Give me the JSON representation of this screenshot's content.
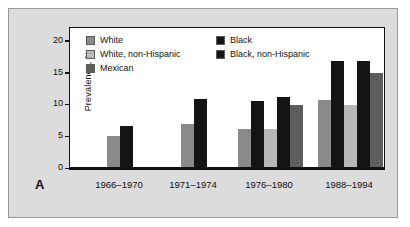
{
  "panel_label": "A",
  "colors": {
    "white": "#8a8a8a",
    "white_non_hispanic": "#b8b8b8",
    "mexican": "#5e5e5e",
    "black": "#141414",
    "black_non_hispanic": "#141414",
    "figure_background": "#dcdcdc",
    "plot_background": "#ffffff",
    "axis": "#111111"
  },
  "legend": {
    "left_column": [
      {
        "label": "White",
        "color": "#8a8a8a"
      },
      {
        "label": "White, non-Hispanic",
        "color": "#b8b8b8"
      },
      {
        "label": "Mexican",
        "color": "#5e5e5e"
      }
    ],
    "right_column": [
      {
        "label": "Black",
        "color": "#141414"
      },
      {
        "label": "Black, non-Hispanic",
        "color": "#141414"
      }
    ]
  },
  "chart_data": {
    "type": "bar",
    "title": "",
    "xlabel": "",
    "ylabel": "Prevalence, %",
    "ylim": [
      0,
      22
    ],
    "yticks": [
      0,
      5,
      10,
      15,
      20
    ],
    "ytick_labels": [
      "0",
      "5",
      "10",
      "15",
      "20"
    ],
    "grid": false,
    "legend_position": "top-left inside",
    "categories": [
      "1966–1970",
      "1971–1974",
      "1976–1980",
      "1988–1994"
    ],
    "series": [
      {
        "name": "White",
        "color": "#8a8a8a",
        "values": [
          5.0,
          6.9,
          6.0,
          10.6
        ]
      },
      {
        "name": "Black",
        "color": "#141414",
        "values": [
          6.5,
          10.8,
          10.5,
          16.8
        ]
      },
      {
        "name": "White, non-Hispanic",
        "color": "#b8b8b8",
        "values": [
          null,
          null,
          6.1,
          9.9
        ]
      },
      {
        "name": "Black, non-Hispanic",
        "color": "#141414",
        "values": [
          null,
          null,
          11.1,
          16.7
        ]
      },
      {
        "name": "Mexican",
        "color": "#5e5e5e",
        "values": [
          null,
          null,
          9.9,
          14.8
        ]
      }
    ]
  }
}
